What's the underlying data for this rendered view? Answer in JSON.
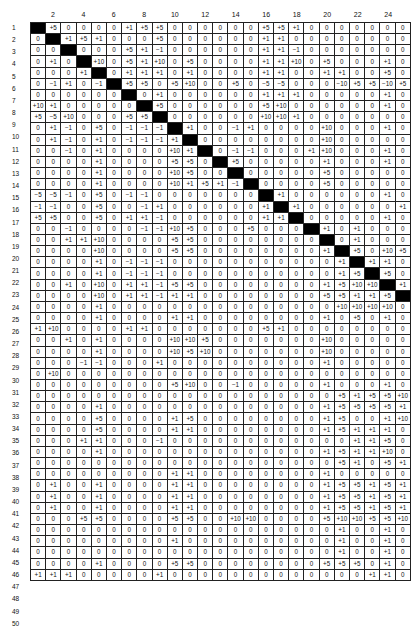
{
  "table": {
    "column_labels": [
      "",
      "2",
      "",
      "4",
      "",
      "6",
      "",
      "8",
      "",
      "10",
      "",
      "12",
      "",
      "14",
      "",
      "16",
      "",
      "18",
      "",
      "20",
      "",
      "22",
      "",
      "24",
      ""
    ],
    "row_labels": [
      "1",
      "2",
      "3",
      "4",
      "5",
      "6",
      "7",
      "8",
      "9",
      "10",
      "11",
      "12",
      "13",
      "14",
      "15",
      "16",
      "17",
      "18",
      "19",
      "20",
      "21",
      "22",
      "23",
      "24",
      "25",
      "26",
      "27",
      "28",
      "29",
      "30",
      "31",
      "32",
      "33",
      "34",
      "35",
      "36",
      "37",
      "38",
      "39",
      "40",
      "41",
      "42",
      "43",
      "44",
      "45",
      "46",
      "47",
      "48",
      "49",
      "50"
    ],
    "black_marker": "B",
    "rows": [
      [
        "B",
        "+5",
        "0",
        "0",
        "0",
        "0",
        "+1",
        "+5",
        "+5",
        "0",
        "0",
        "0",
        "0",
        "0",
        "0",
        "+5",
        "+5",
        "+1",
        "0",
        "0",
        "0",
        "0",
        "0",
        "0",
        "0"
      ],
      [
        "0",
        "B",
        "+1",
        "+5",
        "+1",
        "0",
        "0",
        "0",
        "+5",
        "0",
        "0",
        "0",
        "0",
        "0",
        "0",
        "+1",
        "+1",
        "0",
        "0",
        "0",
        "0",
        "0",
        "0",
        "0",
        "0"
      ],
      [
        "0",
        "0",
        "B",
        "0",
        "0",
        "0",
        "+5",
        "+1",
        "−1",
        "0",
        "0",
        "0",
        "0",
        "0",
        "0",
        "+1",
        "+1",
        "−1",
        "0",
        "0",
        "0",
        "0",
        "0",
        "0",
        "0"
      ],
      [
        "0",
        "+1",
        "0",
        "B",
        "+10",
        "0",
        "+5",
        "+1",
        "+10",
        "0",
        "+5",
        "0",
        "0",
        "0",
        "0",
        "+1",
        "+1",
        "+10",
        "0",
        "+5",
        "0",
        "0",
        "0",
        "+1",
        "0"
      ],
      [
        "0",
        "0",
        "0",
        "+1",
        "B",
        "0",
        "+1",
        "+1",
        "+1",
        "0",
        "+1",
        "0",
        "0",
        "0",
        "0",
        "+1",
        "+1",
        "0",
        "0",
        "+1",
        "+1",
        "0",
        "0",
        "+5",
        "0"
      ],
      [
        "0",
        "−1",
        "+1",
        "0",
        "−1",
        "B",
        "+5",
        "+5",
        "0",
        "+5",
        "+10",
        "0",
        "0",
        "+5",
        "0",
        "−5",
        "−5",
        "0",
        "0",
        "0",
        "−10",
        "+5",
        "+5",
        "−10",
        "+5"
      ],
      [
        "0",
        "0",
        "0",
        "0",
        "0",
        "0",
        "B",
        "0",
        "+1",
        "0",
        "0",
        "0",
        "0",
        "0",
        "0",
        "+1",
        "+1",
        "+1",
        "0",
        "0",
        "0",
        "0",
        "0",
        "+1",
        "0"
      ],
      [
        "+10",
        "+1",
        "0",
        "0",
        "0",
        "0",
        "0",
        "B",
        "+5",
        "0",
        "0",
        "0",
        "0",
        "0",
        "0",
        "+5",
        "+10",
        "0",
        "0",
        "0",
        "0",
        "0",
        "0",
        "+1",
        "0"
      ],
      [
        "+5",
        "−5",
        "+10",
        "0",
        "0",
        "0",
        "+5",
        "+5",
        "B",
        "0",
        "0",
        "0",
        "0",
        "0",
        "0",
        "+10",
        "+10",
        "+1",
        "0",
        "0",
        "0",
        "0",
        "0",
        "0",
        "0"
      ],
      [
        "0",
        "+1",
        "−1",
        "0",
        "+5",
        "0",
        "−1",
        "−1",
        "−1",
        "B",
        "+1",
        "0",
        "0",
        "−1",
        "+1",
        "0",
        "0",
        "0",
        "0",
        "+10",
        "0",
        "0",
        "0",
        "+1",
        "0"
      ],
      [
        "0",
        "+1",
        "−1",
        "0",
        "+1",
        "0",
        "−1",
        "−1",
        "−1",
        "+1",
        "B",
        "0",
        "0",
        "0",
        "0",
        "0",
        "0",
        "0",
        "0",
        "+10",
        "0",
        "0",
        "0",
        "0",
        "0"
      ],
      [
        "0",
        "0",
        "−1",
        "0",
        "+1",
        "0",
        "0",
        "0",
        "0",
        "+10",
        "+1",
        "B",
        "0",
        "−1",
        "−1",
        "0",
        "0",
        "0",
        "+1",
        "+10",
        "0",
        "0",
        "0",
        "+1",
        "0"
      ],
      [
        "0",
        "0",
        "0",
        "0",
        "+1",
        "0",
        "0",
        "0",
        "0",
        "+5",
        "+5",
        "0",
        "B",
        "+5",
        "0",
        "0",
        "0",
        "0",
        "0",
        "+1",
        "0",
        "0",
        "0",
        "+1",
        "0"
      ],
      [
        "0",
        "0",
        "0",
        "0",
        "+1",
        "0",
        "0",
        "0",
        "0",
        "+10",
        "+5",
        "0",
        "0",
        "B",
        "0",
        "0",
        "0",
        "0",
        "0",
        "+5",
        "0",
        "0",
        "0",
        "0",
        "0"
      ],
      [
        "0",
        "0",
        "0",
        "0",
        "+1",
        "0",
        "0",
        "0",
        "0",
        "+10",
        "+1",
        "+5",
        "+1",
        "−1",
        "B",
        "0",
        "0",
        "0",
        "0",
        "+5",
        "0",
        "0",
        "0",
        "0",
        "0"
      ],
      [
        "−5",
        "−5",
        "−1",
        "0",
        "+5",
        "0",
        "−1",
        "−1",
        "0",
        "0",
        "0",
        "0",
        "0",
        "0",
        "0",
        "B",
        "+1",
        "0",
        "0",
        "0",
        "0",
        "0",
        "0",
        "+1",
        "0"
      ],
      [
        "−1",
        "−1",
        "0",
        "0",
        "+5",
        "0",
        "0",
        "−1",
        "+1",
        "0",
        "0",
        "0",
        "0",
        "0",
        "0",
        "+1",
        "B",
        "+1",
        "0",
        "0",
        "0",
        "0",
        "0",
        "0",
        "+1"
      ],
      [
        "+5",
        "+5",
        "0",
        "0",
        "+5",
        "0",
        "+1",
        "+1",
        "−1",
        "0",
        "0",
        "0",
        "0",
        "0",
        "0",
        "+1",
        "+1",
        "B",
        "0",
        "0",
        "0",
        "0",
        "0",
        "+1",
        "0"
      ],
      [
        "0",
        "0",
        "−1",
        "0",
        "0",
        "0",
        "0",
        "−1",
        "−1",
        "+10",
        "+5",
        "0",
        "0",
        "0",
        "+5",
        "0",
        "0",
        "0",
        "B",
        "+1",
        "0",
        "+1",
        "0",
        "0",
        "0"
      ],
      [
        "0",
        "0",
        "+1",
        "+1",
        "+10",
        "0",
        "0",
        "0",
        "0",
        "+5",
        "+5",
        "0",
        "0",
        "0",
        "0",
        "0",
        "0",
        "0",
        "0",
        "B",
        "0",
        "+1",
        "0",
        "0",
        "0"
      ],
      [
        "0",
        "0",
        "0",
        "0",
        "+10",
        "0",
        "0",
        "0",
        "0",
        "+5",
        "+5",
        "0",
        "0",
        "0",
        "0",
        "0",
        "0",
        "0",
        "0",
        "+1",
        "B",
        "+5",
        "0",
        "+10",
        "+5"
      ],
      [
        "0",
        "0",
        "0",
        "0",
        "+1",
        "0",
        "−1",
        "−1",
        "−1",
        "0",
        "0",
        "0",
        "0",
        "0",
        "0",
        "0",
        "0",
        "0",
        "0",
        "0",
        "+1",
        "B",
        "+1",
        "+1",
        "0"
      ],
      [
        "0",
        "0",
        "0",
        "0",
        "+1",
        "0",
        "−1",
        "−1",
        "−1",
        "0",
        "0",
        "0",
        "0",
        "0",
        "0",
        "0",
        "0",
        "0",
        "0",
        "0",
        "+1",
        "+5",
        "B",
        "+5",
        "0"
      ],
      [
        "0",
        "0",
        "+1",
        "0",
        "+10",
        "0",
        "+1",
        "+1",
        "−1",
        "+5",
        "+5",
        "0",
        "0",
        "0",
        "0",
        "0",
        "0",
        "0",
        "0",
        "+1",
        "+5",
        "+10",
        "+10",
        "B",
        "+1"
      ],
      [
        "0",
        "0",
        "0",
        "0",
        "+10",
        "0",
        "+1",
        "+1",
        "−1",
        "+1",
        "+1",
        "0",
        "0",
        "0",
        "0",
        "0",
        "0",
        "0",
        "0",
        "+5",
        "+5",
        "+1",
        "+1",
        "+5",
        "B"
      ],
      [
        "0",
        "0",
        "0",
        "0",
        "+1",
        "0",
        "0",
        "0",
        "0",
        "0",
        "0",
        "0",
        "0",
        "0",
        "0",
        "0",
        "0",
        "0",
        "0",
        "0",
        "+10",
        "+10",
        "+10",
        "+10",
        "0"
      ],
      [
        "0",
        "0",
        "0",
        "0",
        "+1",
        "0",
        "0",
        "0",
        "0",
        "+1",
        "+1",
        "0",
        "0",
        "0",
        "0",
        "0",
        "0",
        "0",
        "0",
        "+1",
        "0",
        "+5",
        "0",
        "+1",
        "0"
      ],
      [
        "+1",
        "+10",
        "0",
        "0",
        "0",
        "0",
        "+1",
        "+1",
        "0",
        "0",
        "0",
        "0",
        "0",
        "0",
        "0",
        "+5",
        "+1",
        "0",
        "0",
        "0",
        "0",
        "0",
        "0",
        "0",
        "0"
      ],
      [
        "0",
        "0",
        "+1",
        "0",
        "+1",
        "0",
        "0",
        "0",
        "0",
        "+10",
        "+10",
        "+5",
        "0",
        "0",
        "0",
        "0",
        "0",
        "0",
        "0",
        "+10",
        "0",
        "0",
        "0",
        "0",
        "0"
      ],
      [
        "0",
        "0",
        "0",
        "0",
        "+1",
        "0",
        "0",
        "0",
        "0",
        "+10",
        "+5",
        "+10",
        "0",
        "0",
        "0",
        "0",
        "0",
        "0",
        "0",
        "+10",
        "0",
        "0",
        "0",
        "0",
        "0"
      ],
      [
        "0",
        "0",
        "0",
        "−1",
        "−1",
        "0",
        "0",
        "0",
        "+1",
        "0",
        "0",
        "0",
        "0",
        "0",
        "0",
        "0",
        "0",
        "0",
        "0",
        "+1",
        "0",
        "0",
        "0",
        "0",
        "0"
      ],
      [
        "0",
        "+10",
        "0",
        "0",
        "0",
        "0",
        "0",
        "0",
        "0",
        "0",
        "0",
        "0",
        "0",
        "0",
        "0",
        "0",
        "0",
        "0",
        "0",
        "0",
        "0",
        "0",
        "0",
        "0",
        "0"
      ],
      [
        "0",
        "0",
        "0",
        "0",
        "0",
        "0",
        "0",
        "0",
        "0",
        "+5",
        "+10",
        "0",
        "0",
        "−1",
        "0",
        "0",
        "0",
        "0",
        "0",
        "+1",
        "0",
        "0",
        "0",
        "+1",
        "0"
      ],
      [
        "0",
        "0",
        "0",
        "0",
        "0",
        "0",
        "0",
        "0",
        "0",
        "0",
        "0",
        "0",
        "0",
        "0",
        "0",
        "0",
        "0",
        "0",
        "0",
        "0",
        "+5",
        "+1",
        "+5",
        "+5",
        "+10"
      ],
      [
        "0",
        "0",
        "0",
        "0",
        "+1",
        "0",
        "0",
        "0",
        "0",
        "0",
        "0",
        "0",
        "0",
        "0",
        "0",
        "0",
        "0",
        "0",
        "0",
        "+1",
        "+5",
        "+5",
        "+5",
        "+5",
        "+1"
      ],
      [
        "0",
        "0",
        "0",
        "0",
        "+5",
        "0",
        "0",
        "0",
        "0",
        "+1",
        "+5",
        "0",
        "0",
        "0",
        "0",
        "0",
        "0",
        "0",
        "0",
        "+1",
        "+5",
        "0",
        "0",
        "+1",
        "+10"
      ],
      [
        "0",
        "0",
        "0",
        "0",
        "+5",
        "0",
        "0",
        "0",
        "0",
        "+1",
        "+1",
        "0",
        "0",
        "0",
        "0",
        "0",
        "0",
        "0",
        "0",
        "+1",
        "+5",
        "+1",
        "+1",
        "+1",
        "0"
      ],
      [
        "0",
        "0",
        "0",
        "+1",
        "+1",
        "0",
        "0",
        "0",
        "−1",
        "0",
        "0",
        "0",
        "0",
        "0",
        "0",
        "0",
        "0",
        "0",
        "0",
        "0",
        "0",
        "+1",
        "+1",
        "+5",
        "0"
      ],
      [
        "0",
        "0",
        "0",
        "0",
        "+1",
        "0",
        "0",
        "0",
        "0",
        "0",
        "0",
        "0",
        "0",
        "0",
        "0",
        "0",
        "0",
        "0",
        "0",
        "+1",
        "+5",
        "+1",
        "+1",
        "+10",
        "0"
      ],
      [
        "0",
        "0",
        "0",
        "0",
        "0",
        "0",
        "0",
        "0",
        "0",
        "0",
        "0",
        "0",
        "0",
        "0",
        "0",
        "0",
        "0",
        "0",
        "0",
        "0",
        "+5",
        "+1",
        "0",
        "+5",
        "+1"
      ],
      [
        "0",
        "0",
        "0",
        "0",
        "0",
        "0",
        "0",
        "0",
        "0",
        "+1",
        "+1",
        "0",
        "0",
        "0",
        "0",
        "0",
        "0",
        "0",
        "0",
        "+1",
        "0",
        "0",
        "0",
        "0",
        "0"
      ],
      [
        "0",
        "+1",
        "0",
        "0",
        "+1",
        "0",
        "0",
        "0",
        "0",
        "+1",
        "+1",
        "0",
        "0",
        "0",
        "0",
        "0",
        "0",
        "0",
        "0",
        "+1",
        "+5",
        "+5",
        "+1",
        "+5",
        "+1"
      ],
      [
        "0",
        "+1",
        "0",
        "0",
        "+1",
        "0",
        "0",
        "0",
        "0",
        "+1",
        "+1",
        "0",
        "0",
        "0",
        "0",
        "0",
        "0",
        "0",
        "0",
        "+1",
        "+5",
        "+5",
        "+1",
        "+5",
        "+1"
      ],
      [
        "0",
        "+1",
        "0",
        "0",
        "+1",
        "0",
        "0",
        "0",
        "0",
        "+1",
        "+1",
        "0",
        "0",
        "0",
        "0",
        "0",
        "0",
        "0",
        "0",
        "+1",
        "+5",
        "+5",
        "+1",
        "+5",
        "+1"
      ],
      [
        "0",
        "0",
        "0",
        "+5",
        "+5",
        "0",
        "0",
        "0",
        "0",
        "+5",
        "+5",
        "0",
        "0",
        "+10",
        "+10",
        "0",
        "0",
        "0",
        "0",
        "+5",
        "+10",
        "+10",
        "+5",
        "+5",
        "+10"
      ],
      [
        "0",
        "0",
        "0",
        "0",
        "0",
        "0",
        "0",
        "0",
        "0",
        "0",
        "0",
        "0",
        "0",
        "0",
        "0",
        "0",
        "0",
        "0",
        "0",
        "0",
        "+1",
        "0",
        "0",
        "+1",
        "0"
      ],
      [
        "0",
        "0",
        "0",
        "0",
        "0",
        "0",
        "0",
        "0",
        "0",
        "+1",
        "0",
        "0",
        "0",
        "0",
        "0",
        "0",
        "0",
        "0",
        "0",
        "0",
        "+1",
        "0",
        "0",
        "+1",
        "0"
      ],
      [
        "0",
        "0",
        "0",
        "0",
        "0",
        "0",
        "0",
        "0",
        "0",
        "0",
        "0",
        "0",
        "0",
        "0",
        "0",
        "0",
        "0",
        "0",
        "0",
        "0",
        "+1",
        "0",
        "0",
        "+1",
        "0"
      ],
      [
        "0",
        "0",
        "0",
        "0",
        "+1",
        "0",
        "0",
        "0",
        "0",
        "+5",
        "+5",
        "0",
        "0",
        "0",
        "0",
        "0",
        "0",
        "0",
        "0",
        "+5",
        "+5",
        "+5",
        "0",
        "+1",
        "0"
      ],
      [
        "+1",
        "+1",
        "+1",
        "0",
        "0",
        "0",
        "0",
        "0",
        "+1",
        "0",
        "0",
        "0",
        "0",
        "0",
        "0",
        "0",
        "0",
        "0",
        "0",
        "0",
        "0",
        "0",
        "+1",
        "+1",
        "0"
      ]
    ]
  },
  "colors": {
    "diagonal_fill": "#000000",
    "grid_line": "#222222",
    "background": "#ffffff"
  }
}
